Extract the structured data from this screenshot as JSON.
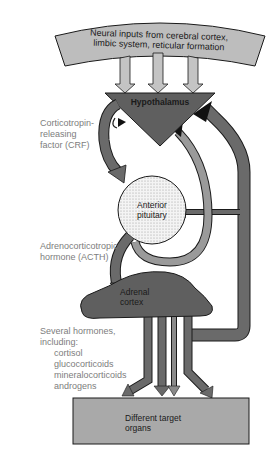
{
  "diagram": {
    "nodes": {
      "neural_inputs": {
        "line1": "Neural inputs from cerebral cortex,",
        "line2": "limbic system, reticular formation"
      },
      "hypothalamus": {
        "label": "Hypothalamus"
      },
      "anterior_pituitary": {
        "line1": "Anterior",
        "line2": "pituitary"
      },
      "adrenal_cortex": {
        "line1": "Adrenal",
        "line2": "cortex"
      },
      "target_organs": {
        "line1": "Different target",
        "line2": "organs"
      }
    },
    "annotations": {
      "crf": {
        "line1": "Corticotropin-",
        "line2": "releasing",
        "line3": "factor (CRF)"
      },
      "acth": {
        "line1": "Adrenocorticotropic",
        "line2": "hormone (ACTH)"
      },
      "hormones": {
        "line1": "Several hormones,",
        "line2": "including:",
        "items": [
          "cortisol",
          "glucocorticoids",
          "mineralocorticoids",
          "androgens"
        ]
      }
    },
    "colors": {
      "dark_fill": "#5f5f5f",
      "light_fill": "#b9b9b9",
      "arrow_gray": "#8a8a8a",
      "target_fill": "#a9a9a9",
      "outline": "#1a1a1a",
      "annotation_text": "#7d7d7d"
    }
  }
}
